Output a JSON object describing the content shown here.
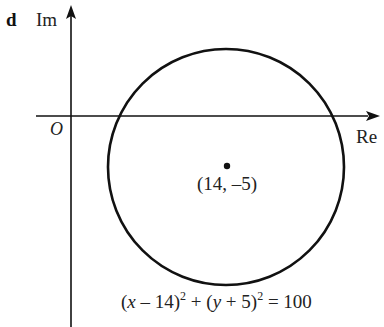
{
  "part_label": "d",
  "axes": {
    "imaginary_label": "Im",
    "real_label": "Re",
    "origin_label": "O"
  },
  "center": {
    "label": "(14, –5)",
    "re": 14,
    "im": -5
  },
  "circle": {
    "radius": 10,
    "equation": {
      "part1": "(",
      "x": "x",
      "part2": " – 14)",
      "sup1": "2",
      "part3": " + (",
      "y": "y",
      "part4": " + 5)",
      "sup2": "2",
      "part5": " = 100"
    }
  },
  "colors": {
    "stroke": "#111111",
    "text": "#222222",
    "background": "#ffffff"
  }
}
